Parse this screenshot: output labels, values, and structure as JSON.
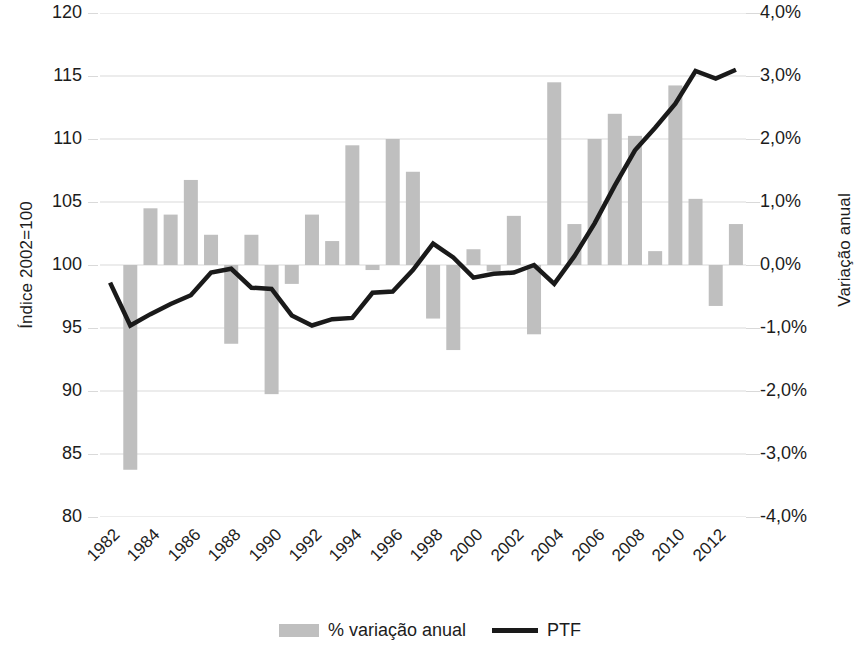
{
  "chart_data": {
    "type": "bar",
    "title": "",
    "subtitle": "",
    "xlabel": "",
    "ylabel": "Índice 2002=100",
    "y2label": "Variação anual",
    "grid": true,
    "legend_position": "bottom",
    "ylim": [
      80,
      120
    ],
    "y2lim": [
      -4.0,
      4.0
    ],
    "yticks": [
      120,
      115,
      110,
      105,
      100,
      95,
      90,
      85,
      80
    ],
    "ytick_labels": [
      "120",
      "115",
      "110",
      "105",
      "100",
      "95",
      "90",
      "85",
      "80"
    ],
    "y2ticks": [
      4.0,
      3.0,
      2.0,
      1.0,
      0.0,
      -1.0,
      -2.0,
      -3.0,
      -4.0
    ],
    "y2tick_labels": [
      "4,0%",
      "3,0%",
      "2,0%",
      "1,0%",
      "0,0%",
      "-1,0%",
      "-2,0%",
      "-3,0%",
      "-4,0%"
    ],
    "categories": [
      "1982",
      "1983",
      "1984",
      "1985",
      "1986",
      "1987",
      "1988",
      "1989",
      "1990",
      "1991",
      "1992",
      "1993",
      "1994",
      "1995",
      "1996",
      "1997",
      "1998",
      "1999",
      "2000",
      "2001",
      "2002",
      "2003",
      "2004",
      "2005",
      "2006",
      "2007",
      "2008",
      "2009",
      "2010",
      "2011",
      "2012",
      "2013"
    ],
    "xtick_labels": [
      "1982",
      "1984",
      "1986",
      "1988",
      "1990",
      "1992",
      "1994",
      "1996",
      "1998",
      "2000",
      "2002",
      "2004",
      "2006",
      "2008",
      "2010",
      "2012"
    ],
    "series": [
      {
        "name": "% variação anual",
        "type": "bar",
        "axis": "right",
        "unit": "%",
        "color": "#bfbfbf",
        "values": [
          null,
          -3.25,
          0.9,
          0.8,
          1.35,
          0.48,
          -1.25,
          0.48,
          -2.05,
          -0.3,
          0.8,
          0.38,
          1.9,
          -0.08,
          2.0,
          1.48,
          -0.85,
          -1.35,
          0.25,
          -0.1,
          0.78,
          -1.1,
          2.9,
          0.65,
          2.0,
          2.4,
          2.05,
          0.22,
          2.85,
          1.05,
          -0.65,
          0.65
        ]
      },
      {
        "name": "PTF",
        "type": "line",
        "axis": "left",
        "unit": "index",
        "color": "#1a1a1a",
        "values": [
          98.6,
          95.2,
          96.1,
          96.9,
          97.6,
          99.4,
          99.7,
          98.2,
          98.1,
          96.0,
          95.2,
          95.7,
          95.8,
          97.8,
          97.9,
          99.6,
          101.7,
          100.6,
          99.0,
          99.3,
          99.4,
          100.0,
          98.5,
          100.7,
          103.3,
          106.3,
          109.1,
          110.9,
          112.8,
          115.4,
          114.8,
          115.5
        ]
      }
    ]
  },
  "legend": {
    "items": [
      {
        "label": "% variação anual",
        "marker": "bar-swatch",
        "color": "#bfbfbf"
      },
      {
        "label": "PTF",
        "marker": "line-swatch",
        "color": "#1a1a1a"
      }
    ]
  },
  "colors": {
    "bar": "#bfbfbf",
    "line": "#1a1a1a",
    "grid": "#d9d9d9",
    "text": "#1c1c1c",
    "background": "#ffffff"
  }
}
